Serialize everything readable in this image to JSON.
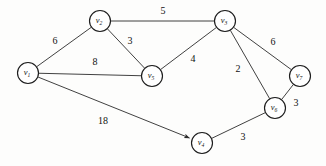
{
  "figure": {
    "background_color": "#fdfdfc",
    "line_color": "#2b2b2b",
    "text_color": "#111111"
  },
  "chart_data": {
    "type": "diagram",
    "title": "",
    "xlabel": "",
    "ylabel": "",
    "grid": false,
    "legend": "none",
    "graph_kind": "weighted graph",
    "nodes": [
      {
        "id": "v1",
        "label": "v",
        "sub": "1",
        "x": 28,
        "y": 73,
        "r": 10.5
      },
      {
        "id": "v2",
        "label": "v",
        "sub": "2",
        "x": 100,
        "y": 21,
        "r": 10.5
      },
      {
        "id": "v3",
        "label": "v",
        "sub": "3",
        "x": 225,
        "y": 21,
        "r": 10.5
      },
      {
        "id": "v4",
        "label": "v",
        "sub": "4",
        "x": 202,
        "y": 143,
        "r": 10.5
      },
      {
        "id": "v5",
        "label": "v",
        "sub": "5",
        "x": 152,
        "y": 76,
        "r": 10.5
      },
      {
        "id": "v6",
        "label": "v",
        "sub": "6",
        "x": 275,
        "y": 108,
        "r": 10.5
      },
      {
        "id": "v7",
        "label": "v",
        "sub": "7",
        "x": 300,
        "y": 76,
        "r": 10.5
      }
    ],
    "edges": [
      {
        "id": "e-v1-v2",
        "from": "v1",
        "to": "v2",
        "weight": "6",
        "label_x": 55,
        "label_y": 42,
        "arrow": false
      },
      {
        "id": "e-v2-v3",
        "from": "v2",
        "to": "v3",
        "weight": "5",
        "label_x": 163,
        "label_y": 12,
        "arrow": false
      },
      {
        "id": "e-v2-v5",
        "from": "v2",
        "to": "v5",
        "weight": "3",
        "label_x": 130,
        "label_y": 42,
        "arrow": false
      },
      {
        "id": "e-v1-v5",
        "from": "v1",
        "to": "v5",
        "weight": "8",
        "label_x": 95,
        "label_y": 63,
        "arrow": false
      },
      {
        "id": "e-v5-v3",
        "from": "v5",
        "to": "v3",
        "weight": "4",
        "label_x": 193,
        "label_y": 60,
        "arrow": false
      },
      {
        "id": "e-v3-v7",
        "from": "v3",
        "to": "v7",
        "weight": "6",
        "label_x": 273,
        "label_y": 43,
        "arrow": false
      },
      {
        "id": "e-v3-v6",
        "from": "v3",
        "to": "v6",
        "weight": "2",
        "label_x": 238,
        "label_y": 70,
        "arrow": false
      },
      {
        "id": "e-v7-v6",
        "from": "v7",
        "to": "v6",
        "weight": "3",
        "label_x": 296,
        "label_y": 104,
        "arrow": false
      },
      {
        "id": "e-v1-v4",
        "from": "v1",
        "to": "v4",
        "weight": "18",
        "label_x": 103,
        "label_y": 122,
        "arrow": true
      },
      {
        "id": "e-v4-v6",
        "from": "v4",
        "to": "v6",
        "weight": "3",
        "label_x": 243,
        "label_y": 138,
        "arrow": false
      }
    ]
  }
}
